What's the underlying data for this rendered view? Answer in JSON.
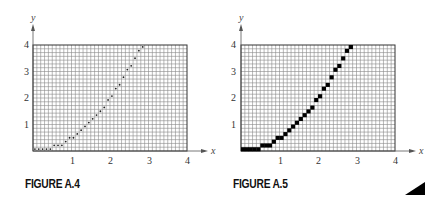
{
  "figures": [
    {
      "id": "A.4",
      "caption": "FIGURE A.4",
      "style": "dots",
      "axis": {
        "x_label": "x",
        "y_label": "y",
        "x_ticks": [
          "1",
          "2",
          "3",
          "4"
        ],
        "y_ticks": [
          "1",
          "2",
          "3",
          "4"
        ]
      },
      "box": {
        "left": 33,
        "top": 45,
        "right": 187,
        "bottom": 151
      },
      "grid": {
        "cols": 40,
        "rows": 28
      }
    },
    {
      "id": "A.5",
      "caption": "FIGURE A.5",
      "style": "blocks",
      "axis": {
        "x_label": "x",
        "y_label": "y",
        "x_ticks": [
          "1",
          "2",
          "3",
          "4"
        ],
        "y_ticks": [
          "1",
          "2",
          "3",
          "4"
        ]
      },
      "box": {
        "left": 19,
        "top": 45,
        "right": 173,
        "bottom": 151
      },
      "grid": {
        "cols": 40,
        "rows": 28
      }
    }
  ],
  "chart_data": [
    {
      "type": "scatter",
      "title": "FIGURE A.4",
      "description": "Rasterized curve y = x^2/2 shown as dotted pixel centers on a grid",
      "xlabel": "x",
      "ylabel": "y",
      "xlim": [
        0,
        4
      ],
      "ylim": [
        0,
        4
      ],
      "x_ticks": [
        1,
        2,
        3,
        4
      ],
      "y_ticks": [
        1,
        2,
        3,
        4
      ],
      "grid": true,
      "pixel_cells": {
        "col": [
          0,
          1,
          2,
          3,
          4,
          5,
          6,
          7,
          8,
          9,
          10,
          11,
          12,
          13,
          14,
          15,
          16,
          17,
          18,
          19,
          20,
          21,
          22,
          23,
          24,
          25,
          26,
          27,
          28
        ],
        "row": [
          0,
          0,
          0,
          0,
          0,
          1,
          1,
          1,
          2,
          3,
          3,
          4,
          5,
          6,
          7,
          8,
          9,
          10,
          11,
          13,
          14,
          16,
          17,
          19,
          21,
          22,
          24,
          26,
          27
        ]
      }
    },
    {
      "type": "heatmap",
      "title": "FIGURE A.5",
      "description": "Rasterized curve y = x^2/2 shown as filled black pixels on a grid",
      "xlabel": "x",
      "ylabel": "y",
      "xlim": [
        0,
        4
      ],
      "ylim": [
        0,
        4
      ],
      "x_ticks": [
        1,
        2,
        3,
        4
      ],
      "y_ticks": [
        1,
        2,
        3,
        4
      ],
      "grid": true,
      "pixel_cells": {
        "col": [
          0,
          1,
          2,
          3,
          4,
          5,
          6,
          7,
          8,
          9,
          10,
          11,
          12,
          13,
          14,
          15,
          16,
          17,
          18,
          19,
          20,
          21,
          22,
          23,
          24,
          25,
          26,
          27,
          28
        ],
        "row": [
          0,
          0,
          0,
          0,
          0,
          1,
          1,
          1,
          2,
          3,
          3,
          4,
          5,
          6,
          7,
          8,
          9,
          10,
          11,
          13,
          14,
          16,
          17,
          19,
          21,
          22,
          24,
          26,
          27
        ]
      }
    }
  ],
  "colors": {
    "grid": "#8a8a8a",
    "frame": "#333333",
    "ink": "#000000"
  }
}
